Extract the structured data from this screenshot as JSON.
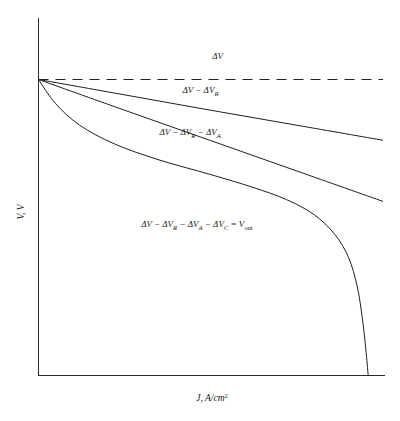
{
  "chart_data": {
    "type": "line",
    "title": "",
    "xlabel": "J, A/cm2",
    "xlabel_main": "J",
    "xlabel_rest": ", A/cm",
    "xlabel_sup": "2",
    "ylabel": "V, V",
    "ylabel_main": "V",
    "ylabel_rest": ", V",
    "grid": false,
    "legend": "inline-annotations",
    "axis_ticks": "none",
    "xlim": [
      0,
      1
    ],
    "ylim": [
      0,
      1
    ],
    "series": [
      {
        "name": "dV",
        "label": "ΔV",
        "style": "dashed",
        "points": [
          [
            0.0,
            0.828
          ],
          [
            1.0,
            0.828
          ]
        ]
      },
      {
        "name": "dV-dVR",
        "label": "ΔV − ΔV_R",
        "style": "solid",
        "points": [
          [
            0.0,
            0.828
          ],
          [
            0.25,
            0.785
          ],
          [
            0.5,
            0.742
          ],
          [
            0.75,
            0.7
          ],
          [
            1.0,
            0.658
          ]
        ]
      },
      {
        "name": "dV-dVR-dVA",
        "label": "ΔV − ΔV_R − ΔV_A",
        "style": "solid",
        "points": [
          [
            0.0,
            0.828
          ],
          [
            0.25,
            0.742
          ],
          [
            0.5,
            0.657
          ],
          [
            0.75,
            0.572
          ],
          [
            1.0,
            0.487
          ]
        ]
      },
      {
        "name": "Vout",
        "label": "ΔV − ΔV_R − ΔV_A − ΔV_C = V_out",
        "style": "solid",
        "points": [
          [
            0.0,
            0.828
          ],
          [
            0.05,
            0.76
          ],
          [
            0.12,
            0.7
          ],
          [
            0.22,
            0.648
          ],
          [
            0.35,
            0.603
          ],
          [
            0.5,
            0.562
          ],
          [
            0.62,
            0.527
          ],
          [
            0.72,
            0.492
          ],
          [
            0.8,
            0.45
          ],
          [
            0.86,
            0.395
          ],
          [
            0.9,
            0.33
          ],
          [
            0.925,
            0.25
          ],
          [
            0.94,
            0.16
          ],
          [
            0.95,
            0.075
          ],
          [
            0.957,
            0.0
          ]
        ]
      }
    ],
    "annotations": [
      {
        "name": "annotation-dv",
        "parts": [
          {
            "t": "ΔV",
            "k": "b"
          }
        ],
        "x": 0.52,
        "y": 0.885
      },
      {
        "name": "annotation-dv-dvr",
        "parts": [
          {
            "t": "ΔV − ΔV",
            "k": "b"
          },
          {
            "t": "R",
            "k": "sub"
          }
        ],
        "x": 0.47,
        "y": 0.79
      },
      {
        "name": "annotation-dv-dvr-dva",
        "parts": [
          {
            "t": "ΔV − ΔV",
            "k": "b"
          },
          {
            "t": "R",
            "k": "sub"
          },
          {
            "t": " − ΔV",
            "k": "b"
          },
          {
            "t": "A",
            "k": "sub"
          }
        ],
        "x": 0.44,
        "y": 0.672
      },
      {
        "name": "annotation-vout",
        "parts": [
          {
            "t": "ΔV − ΔV",
            "k": "b"
          },
          {
            "t": "R",
            "k": "sub"
          },
          {
            "t": " − ΔV",
            "k": "b"
          },
          {
            "t": "A",
            "k": "sub"
          },
          {
            "t": " − ΔV",
            "k": "b"
          },
          {
            "t": "C",
            "k": "sub"
          },
          {
            "t": " = V",
            "k": "b"
          },
          {
            "t": "out",
            "k": "sub-up"
          }
        ],
        "x": 0.46,
        "y": 0.415
      }
    ]
  },
  "colors": {
    "axis": "#2b2b2b",
    "curve": "#202020",
    "background": "#ffffff",
    "text": "#1a1a1a"
  }
}
